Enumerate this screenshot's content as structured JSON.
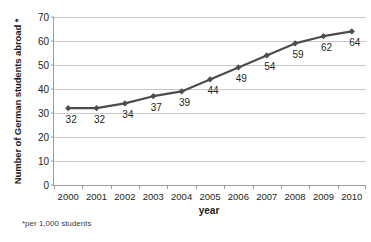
{
  "chart_data": {
    "type": "line",
    "title": "",
    "xlabel": "year",
    "ylabel": "Number of German students abroad *",
    "categories": [
      "2000",
      "2001",
      "2002",
      "2003",
      "2004",
      "2005",
      "2006",
      "2007",
      "2008",
      "2009",
      "2010"
    ],
    "values": [
      32,
      32,
      34,
      37,
      39,
      44,
      49,
      54,
      59,
      62,
      64
    ],
    "data_labels": [
      "32",
      "32",
      "34",
      "37",
      "39",
      "44",
      "49",
      "54",
      "59",
      "62",
      "64"
    ],
    "ylim": [
      0,
      70
    ],
    "y_ticks": [
      "0",
      "10",
      "20",
      "30",
      "40",
      "50",
      "60",
      "70"
    ],
    "y_tick_values": [
      0,
      10,
      20,
      30,
      40,
      50,
      60,
      70
    ],
    "grid": true,
    "legend": "none",
    "series_color": "#4d4d4d",
    "marker": "diamond",
    "footnote": "*per 1,000 students",
    "gridline_color": "#c8c8c8",
    "axis_color": "#9c9c9c"
  }
}
